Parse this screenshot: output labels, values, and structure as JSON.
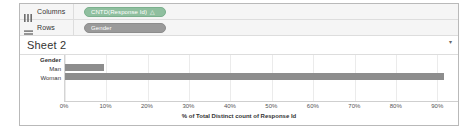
{
  "shelves": [
    {
      "name": "columns",
      "label": "Columns",
      "icon": "columns-icon",
      "pill": {
        "text": "CNTD(Response Id)",
        "glyph": "△",
        "color": "#8fbf9f"
      }
    },
    {
      "name": "rows",
      "label": "Rows",
      "icon": "rows-icon",
      "pill": {
        "text": "Gender",
        "glyph": "",
        "color": "#9a9a9a"
      }
    }
  ],
  "sheet": {
    "title": "Sheet 2",
    "caret": "▾"
  },
  "chart_data": {
    "type": "bar",
    "orientation": "horizontal",
    "title": "Sheet 2",
    "field_caption": "Gender",
    "categories": [
      "Man",
      "Woman"
    ],
    "values": [
      9.5,
      91.5
    ],
    "series": [
      {
        "name": "% of Total Distinct count of Response Id",
        "values": [
          9.5,
          91.5
        ]
      }
    ],
    "xlabel": "% of Total Distinct count of Response Id",
    "ylabel": "Gender",
    "xlim": [
      0,
      95
    ],
    "xticks": [
      0,
      10,
      20,
      30,
      40,
      50,
      60,
      70,
      80,
      90
    ],
    "xticklabels": [
      "0%",
      "10%",
      "20%",
      "30%",
      "40%",
      "50%",
      "60%",
      "70%",
      "80%",
      "90%"
    ],
    "grid": true,
    "legend": false,
    "bar_color": "#8d8d8d"
  }
}
